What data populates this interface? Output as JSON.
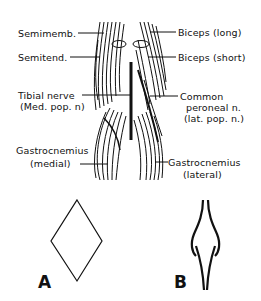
{
  "diagram": {
    "labels_left": {
      "semimemb": "Semimemb.",
      "semitend": "Semitend.",
      "tibial_nerve_1": "Tibial nerve",
      "tibial_nerve_2": "(Med. pop. n)",
      "gastroc_medial_1": "Gastrocnemius",
      "gastroc_medial_2": "(medial)"
    },
    "labels_right": {
      "biceps_long": "Biceps (long)",
      "biceps_short": "Biceps (short)",
      "common_peroneal_1": "Common",
      "common_peroneal_2": "peroneal n.",
      "common_peroneal_3": "(lat. pop. n.)",
      "gastroc_lateral_1": "Gastrocnemius",
      "gastroc_lateral_2": "(lateral)"
    },
    "figure_letters": {
      "a": "A",
      "b": "B"
    },
    "caption_partial": ""
  }
}
